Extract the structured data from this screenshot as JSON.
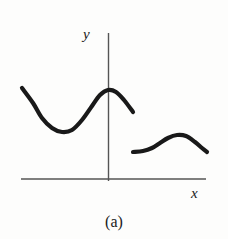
{
  "figure": {
    "caption": "(a)",
    "background_color": "#fdfdfc",
    "width": 228,
    "height": 239
  },
  "axes": {
    "x_label": "x",
    "y_label": "y",
    "axis_color": "#555555",
    "x_axis": {
      "x1": 21,
      "y1": 179,
      "x2": 206,
      "y2": 179
    },
    "y_axis": {
      "x1": 108.5,
      "y1": 33,
      "x2": 108.5,
      "y2": 181
    }
  },
  "chart_data": {
    "type": "line",
    "title": "(a)",
    "xlabel": "x",
    "ylabel": "y",
    "grid": false,
    "legend": null,
    "annotations": [],
    "axis_origin_px": {
      "x": 108.5,
      "y": 179
    },
    "curve_color": "#191919",
    "curve_width": 4.2,
    "series": [
      {
        "name": "left-branch",
        "description": "S-shaped branch: starts upper left, dips to a minimum, rises to a local maximum at the y-axis, then falls to an open right end",
        "points_px": [
          [
            22,
            88
          ],
          [
            33,
            103
          ],
          [
            42,
            118
          ],
          [
            52,
            128
          ],
          [
            62,
            132
          ],
          [
            72,
            130
          ],
          [
            82,
            120
          ],
          [
            92,
            106
          ],
          [
            100,
            95
          ],
          [
            108,
            90
          ],
          [
            116,
            92
          ],
          [
            124,
            100
          ],
          [
            133,
            112
          ]
        ]
      },
      {
        "name": "right-branch",
        "description": "Low hump to the right of the y-axis: nearly flat start, rises to a local maximum, then falls to an open right end",
        "points_px": [
          [
            133,
            152
          ],
          [
            143,
            151
          ],
          [
            152,
            148
          ],
          [
            160,
            143
          ],
          [
            168,
            138
          ],
          [
            177,
            135
          ],
          [
            186,
            136
          ],
          [
            195,
            142
          ],
          [
            202,
            148
          ],
          [
            207,
            152
          ]
        ]
      }
    ]
  }
}
